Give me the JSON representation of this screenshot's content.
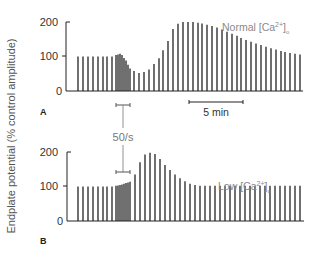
{
  "figure": {
    "ylabel": "Endplate potential (% control amplitude)",
    "stim_label": "50/s",
    "time_scale_label": "5 min"
  },
  "panels": [
    {
      "id": "A",
      "label": "A",
      "condition": "Normal [Ca",
      "condition_sup": "2+",
      "condition_sub": "o",
      "yticks": [
        "0",
        "100",
        "200"
      ]
    },
    {
      "id": "B",
      "label": "B",
      "condition": "Low [Ca",
      "condition_sup": "2+",
      "condition_sub": "o",
      "yticks": [
        "0",
        "100",
        "200"
      ]
    }
  ],
  "chart_data": [
    {
      "type": "bar",
      "title": "A — Normal [Ca2+]o",
      "xlabel": "Time (scale bar = 5 min)",
      "ylabel": "Endplate potential (% control amplitude)",
      "ylim": [
        0,
        200
      ],
      "yticks": [
        0,
        100,
        200
      ],
      "grid": false,
      "annotations": [
        "50/s tetanic stimulation bar",
        "5 min scale bar",
        "Normal [Ca2+]o"
      ],
      "x": [
        78,
        83,
        88,
        93,
        98,
        103,
        107,
        112,
        116,
        118,
        120,
        122,
        124,
        126,
        128,
        130,
        134,
        139,
        144,
        149,
        154,
        159,
        163,
        168,
        173,
        178,
        183,
        188,
        193,
        198,
        202,
        207,
        212,
        217,
        222,
        227,
        232,
        237,
        241,
        246,
        251,
        256,
        261,
        266,
        271,
        276,
        281,
        285,
        290,
        295,
        300
      ],
      "values": [
        100,
        100,
        100,
        100,
        100,
        100,
        100,
        100,
        104,
        106,
        108,
        104,
        96,
        88,
        76,
        65,
        58,
        52,
        55,
        62,
        78,
        95,
        118,
        145,
        180,
        195,
        200,
        200,
        200,
        198,
        196,
        192,
        188,
        184,
        178,
        172,
        166,
        160,
        154,
        148,
        143,
        138,
        133,
        128,
        124,
        120,
        116,
        113,
        110,
        108,
        106
      ]
    },
    {
      "type": "bar",
      "title": "B — Low [Ca2+]o",
      "xlabel": "Time",
      "ylabel": "Endplate potential (% control amplitude)",
      "ylim": [
        0,
        200
      ],
      "yticks": [
        0,
        100,
        200
      ],
      "grid": false,
      "annotations": [
        "50/s tetanic stimulation bar",
        "Low [Ca2+]o"
      ],
      "x": [
        78,
        83,
        88,
        93,
        98,
        103,
        107,
        112,
        116,
        118,
        120,
        122,
        124,
        126,
        128,
        130,
        135,
        140,
        145,
        150,
        155,
        160,
        165,
        170,
        175,
        180,
        185,
        190,
        195,
        200,
        205,
        210,
        215,
        220,
        225,
        230,
        235,
        240,
        245,
        250,
        255,
        260,
        265,
        270,
        275,
        280,
        285,
        290,
        295,
        300
      ],
      "values": [
        100,
        100,
        100,
        100,
        100,
        100,
        100,
        100,
        102,
        103,
        104,
        106,
        108,
        110,
        112,
        114,
        135,
        170,
        193,
        198,
        194,
        180,
        162,
        148,
        135,
        124,
        115,
        108,
        104,
        102,
        102,
        102,
        102,
        102,
        102,
        102,
        102,
        102,
        102,
        102,
        102,
        102,
        102,
        102,
        102,
        102,
        102,
        102,
        102,
        102
      ]
    }
  ]
}
